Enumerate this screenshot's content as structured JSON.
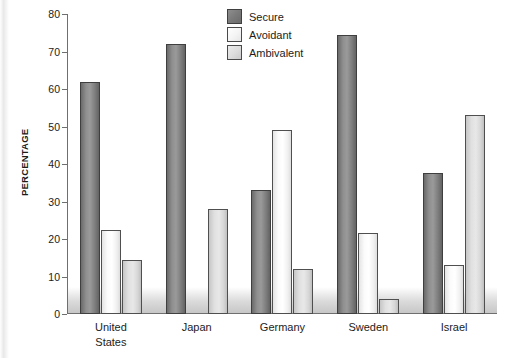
{
  "chart_data": {
    "type": "bar",
    "title": "",
    "xlabel": "",
    "ylabel": "PERCENTAGE",
    "ylim": [
      0,
      80
    ],
    "ytick_step": 10,
    "yticks": [
      0,
      10,
      20,
      30,
      40,
      50,
      60,
      70,
      80
    ],
    "grid": false,
    "legend_position": "top-center",
    "categories": [
      "United\nStates",
      "Japan",
      "Germany",
      "Sweden",
      "Israel"
    ],
    "series": [
      {
        "name": "Secure",
        "color": "#7d7d7d",
        "values": [
          62,
          72,
          33,
          74.5,
          37.5
        ]
      },
      {
        "name": "Avoidant",
        "color": "#f7f7f7",
        "values": [
          22.5,
          0,
          49,
          21.5,
          13
        ]
      },
      {
        "name": "Ambivalent",
        "color": "#dcdcdc",
        "values": [
          14.5,
          28,
          12,
          4,
          53
        ]
      }
    ]
  },
  "legend": {
    "items": [
      {
        "label": "Secure"
      },
      {
        "label": "Avoidant"
      },
      {
        "label": "Ambivalent"
      }
    ]
  },
  "axis": {
    "y_title": "PERCENTAGE",
    "tick_labels": [
      "0",
      "10",
      "20",
      "30",
      "40",
      "50",
      "60",
      "70",
      "80"
    ]
  }
}
